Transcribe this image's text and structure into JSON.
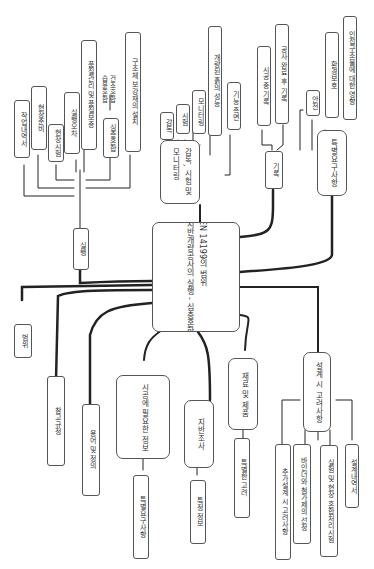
{
  "center": {
    "line1": "EN 14199의 범위",
    "line2": "지반개량공사의 실행 - 심층혼합"
  },
  "branches": {
    "execution": {
      "label": "실행",
      "children": [
        "작업내역서",
        "현장준비",
        "현장시험",
        "실행오차",
        "품질관리 및 품질보증",
        "심층혼합",
        "구조체 보강재의 설치"
      ],
      "note": {
        "line1": "건조혼합",
        "line2": "습윤혼합"
      }
    },
    "supervision": {
      "label_line1": "감독, 시험 및",
      "label_line2": "모니터링",
      "children": [
        "감독",
        "시험",
        "모니터링",
        "개량된 흙의 성능",
        "기능 측면"
      ]
    },
    "records": {
      "label": "기록",
      "children": [
        "시공 중 기록",
        "공사 완료 후 기록"
      ]
    },
    "special": {
      "label": "특별요구사항",
      "children": [
        "안전",
        "환경보호",
        "인접구조물에 대한 영향"
      ]
    },
    "scope": {
      "label": "범위"
    },
    "references": {
      "label": "참고규정"
    },
    "terms": {
      "label": "용어 및 정의"
    },
    "info": {
      "label": "시공에 필요한 정보",
      "children": [
        "특별요구사항"
      ]
    },
    "site": {
      "label": "지반조사",
      "children": [
        "특정 정보"
      ]
    },
    "materials": {
      "label": "재료 및 제품",
      "children": [
        "특별한 고려"
      ]
    },
    "design": {
      "label": "설계 시 고려사항",
      "children": [
        "추가설계 시 고려사항",
        "바인더와 첨가제의 선정",
        "실험 및 현장 혼합처리시험",
        "설계내역서"
      ]
    }
  }
}
